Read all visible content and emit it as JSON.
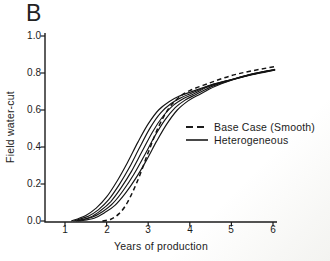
{
  "figure": {
    "panel_label": "B",
    "background_color": "#ffffff",
    "ink_color": "#1b1b1b"
  },
  "chart_data": {
    "type": "line",
    "title": "",
    "xlabel": "Years of production",
    "ylabel": "Field water-cut",
    "xlim": [
      0.5,
      6.1
    ],
    "ylim": [
      0.0,
      1.0
    ],
    "grid": false,
    "x_ticks": [
      1,
      2,
      3,
      4,
      5,
      6
    ],
    "x_tick_labels": [
      "1",
      "2",
      "3",
      "4",
      "5",
      "6"
    ],
    "y_ticks": [
      0.0,
      0.2,
      0.4,
      0.6,
      0.8,
      1.0
    ],
    "y_tick_labels": [
      "0.0",
      "0.2",
      "0.4",
      "0.6",
      "0.8",
      "1.0"
    ],
    "legend": [
      {
        "label": "Base Case (Smooth)",
        "style": "dashed"
      },
      {
        "label": "Heterogeneous",
        "style": "solid"
      }
    ],
    "legend_position": "right-middle",
    "series": [
      {
        "name": "Heterogeneous 1",
        "style": "solid",
        "x": [
          1.15,
          1.5,
          1.75,
          2.0,
          2.25,
          2.5,
          2.75,
          3.0,
          3.25,
          3.5,
          3.75,
          4.0,
          4.5,
          5.0,
          5.5,
          6.05
        ],
        "y": [
          0.0,
          0.03,
          0.07,
          0.13,
          0.215,
          0.315,
          0.425,
          0.525,
          0.6,
          0.645,
          0.675,
          0.695,
          0.735,
          0.765,
          0.795,
          0.82
        ]
      },
      {
        "name": "Heterogeneous 2",
        "style": "solid",
        "x": [
          1.2,
          1.55,
          1.8,
          2.05,
          2.3,
          2.55,
          2.8,
          3.05,
          3.3,
          3.55,
          3.8,
          4.05,
          4.5,
          5.0,
          5.5,
          6.05
        ],
        "y": [
          0.0,
          0.025,
          0.06,
          0.115,
          0.195,
          0.29,
          0.4,
          0.505,
          0.585,
          0.635,
          0.668,
          0.692,
          0.733,
          0.764,
          0.794,
          0.819
        ]
      },
      {
        "name": "Heterogeneous 3",
        "style": "solid",
        "x": [
          1.25,
          1.6,
          1.85,
          2.1,
          2.35,
          2.6,
          2.85,
          3.1,
          3.35,
          3.6,
          3.85,
          4.1,
          4.5,
          5.0,
          5.5,
          6.05
        ],
        "y": [
          0.0,
          0.02,
          0.055,
          0.105,
          0.18,
          0.27,
          0.375,
          0.48,
          0.565,
          0.625,
          0.662,
          0.688,
          0.731,
          0.763,
          0.793,
          0.818
        ]
      },
      {
        "name": "Heterogeneous 4",
        "style": "solid",
        "x": [
          1.3,
          1.65,
          1.9,
          2.15,
          2.4,
          2.65,
          2.9,
          3.15,
          3.4,
          3.65,
          3.9,
          4.15,
          4.55,
          5.0,
          5.5,
          6.05
        ],
        "y": [
          0.0,
          0.02,
          0.05,
          0.095,
          0.165,
          0.25,
          0.35,
          0.455,
          0.545,
          0.613,
          0.655,
          0.684,
          0.729,
          0.762,
          0.792,
          0.817
        ]
      },
      {
        "name": "Heterogeneous 5",
        "style": "solid",
        "x": [
          1.35,
          1.7,
          1.95,
          2.2,
          2.45,
          2.7,
          2.95,
          3.2,
          3.45,
          3.7,
          3.95,
          4.2,
          4.6,
          5.0,
          5.5,
          6.05
        ],
        "y": [
          0.0,
          0.015,
          0.045,
          0.085,
          0.15,
          0.23,
          0.325,
          0.43,
          0.525,
          0.6,
          0.648,
          0.68,
          0.727,
          0.761,
          0.791,
          0.816
        ]
      },
      {
        "name": "Base Case (Smooth)",
        "style": "dashed",
        "x": [
          1.9,
          2.1,
          2.3,
          2.5,
          2.75,
          3.0,
          3.25,
          3.5,
          3.75,
          4.0,
          4.5,
          5.0,
          5.5,
          6.05
        ],
        "y": [
          0.0,
          0.01,
          0.04,
          0.1,
          0.22,
          0.37,
          0.51,
          0.61,
          0.67,
          0.705,
          0.748,
          0.786,
          0.812,
          0.835
        ]
      }
    ]
  }
}
